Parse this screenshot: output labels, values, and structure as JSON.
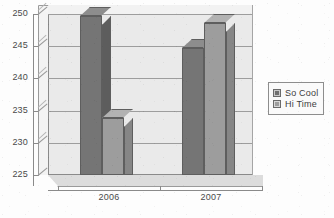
{
  "chart_data": {
    "type": "bar",
    "title": "",
    "subtitle": "",
    "xlabel": "",
    "ylabel": "",
    "categories": [
      "2006",
      "2007"
    ],
    "series": [
      {
        "name": "So Cool",
        "color": "#757575",
        "values": [
          249.7,
          244.7
        ]
      },
      {
        "name": "Hi Time",
        "color": "#9d9d9d",
        "values": [
          233.9,
          248.6
        ]
      }
    ],
    "ylim": [
      225,
      250
    ],
    "yticks": [
      225,
      230,
      235,
      240,
      245,
      250
    ],
    "ytick_labels": [
      "225",
      "230",
      "235",
      "240",
      "245",
      "250"
    ],
    "grid": true,
    "grid_axis": "y",
    "legend_position": "right",
    "style": "3d-bar",
    "background": "#eaeaea"
  },
  "legend": {
    "entries": [
      {
        "label": "So Cool"
      },
      {
        "label": "Hi Time"
      }
    ]
  },
  "axes": {
    "x_labels": [
      "2006",
      "2007"
    ],
    "y_labels": [
      "250",
      "245",
      "240",
      "235",
      "230",
      "225"
    ]
  }
}
